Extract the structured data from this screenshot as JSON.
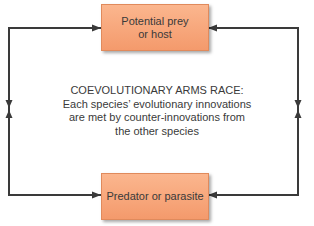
{
  "diagram": {
    "top_box": {
      "label": "Potential prey or host"
    },
    "bottom_box": {
      "label": "Predator or parasite"
    },
    "center": {
      "title": "COEVOLUTIONARY ARMS RACE:",
      "lines": [
        "Each species’ evolutionary innovations",
        "are met by counter-innovations from",
        "the other species"
      ]
    },
    "colors": {
      "box_fill": "#f7a678",
      "line": "#3a3a3a"
    }
  }
}
